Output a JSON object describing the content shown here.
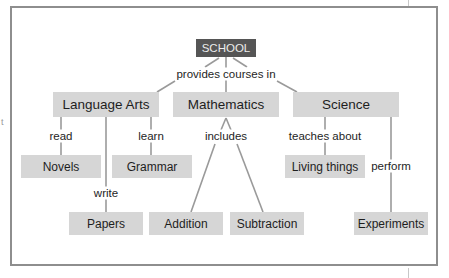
{
  "diagram": {
    "type": "concept-map",
    "colors": {
      "frame": "#8e8e8e",
      "node_fill": "#d6d6d6",
      "root_fill": "#555555",
      "root_text": "#ececec",
      "edge": "#9a9a9a",
      "text": "#1e1e1e"
    },
    "artifact_text": "t",
    "root": {
      "label": "SCHOOL"
    },
    "nodes": {
      "language_arts": "Language Arts",
      "mathematics": "Mathematics",
      "science": "Science",
      "novels": "Novels",
      "grammar": "Grammar",
      "papers": "Papers",
      "addition": "Addition",
      "subtraction": "Subtraction",
      "living_things": "Living things",
      "experiments": "Experiments"
    },
    "links": {
      "provides_courses_in": "provides courses in",
      "read": "read",
      "learn": "learn",
      "write": "write",
      "includes": "includes",
      "teaches_about": "teaches about",
      "perform": "perform"
    },
    "edges": [
      {
        "from": "SCHOOL",
        "label": "provides courses in",
        "to": [
          "Language Arts",
          "Mathematics",
          "Science"
        ]
      },
      {
        "from": "Language Arts",
        "label": "read",
        "to": [
          "Novels"
        ]
      },
      {
        "from": "Language Arts",
        "label": "learn",
        "to": [
          "Grammar"
        ]
      },
      {
        "from": "Language Arts",
        "label": "write",
        "to": [
          "Papers"
        ]
      },
      {
        "from": "Mathematics",
        "label": "includes",
        "to": [
          "Addition",
          "Subtraction"
        ]
      },
      {
        "from": "Science",
        "label": "teaches about",
        "to": [
          "Living things"
        ]
      },
      {
        "from": "Science",
        "label": "perform",
        "to": [
          "Experiments"
        ]
      }
    ]
  }
}
